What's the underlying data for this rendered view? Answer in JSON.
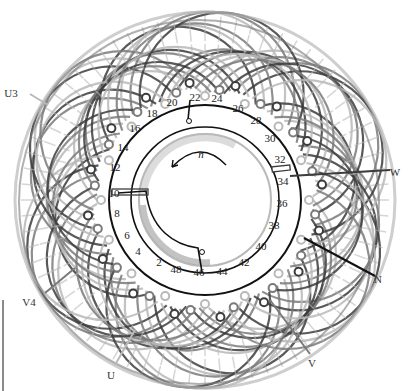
{
  "diagram": {
    "center": {
      "x": 205,
      "y": 200
    },
    "colors": {
      "phase_dark": "#3c3c3c",
      "phase_mid": "#7a7a7a",
      "phase_light": "#b9b9b9",
      "ring": "#111111",
      "background": "#ffffff"
    },
    "rotation_label": "n",
    "slot_labels": [
      {
        "text": "2",
        "x": 159,
        "y": 263
      },
      {
        "text": "4",
        "x": 138,
        "y": 252
      },
      {
        "text": "6",
        "x": 127,
        "y": 236
      },
      {
        "text": "8",
        "x": 117,
        "y": 214
      },
      {
        "text": "10",
        "x": 114,
        "y": 194
      },
      {
        "text": "12",
        "x": 115,
        "y": 168
      },
      {
        "text": "14",
        "x": 123,
        "y": 148
      },
      {
        "text": "16",
        "x": 135,
        "y": 129
      },
      {
        "text": "18",
        "x": 152,
        "y": 114
      },
      {
        "text": "20",
        "x": 172,
        "y": 103
      },
      {
        "text": "22",
        "x": 195,
        "y": 98
      },
      {
        "text": "24",
        "x": 217,
        "y": 99
      },
      {
        "text": "26",
        "x": 238,
        "y": 109
      },
      {
        "text": "28",
        "x": 256,
        "y": 121
      },
      {
        "text": "30",
        "x": 270,
        "y": 139
      },
      {
        "text": "32",
        "x": 280,
        "y": 160
      },
      {
        "text": "34",
        "x": 283,
        "y": 182
      },
      {
        "text": "36",
        "x": 282,
        "y": 204
      },
      {
        "text": "38",
        "x": 274,
        "y": 226
      },
      {
        "text": "40",
        "x": 261,
        "y": 247
      },
      {
        "text": "42",
        "x": 244,
        "y": 263
      },
      {
        "text": "44",
        "x": 222,
        "y": 272
      },
      {
        "text": "46",
        "x": 199,
        "y": 273
      },
      {
        "text": "48",
        "x": 176,
        "y": 270
      }
    ],
    "terminals": [
      {
        "text": "U3",
        "x": 11,
        "y": 94,
        "lx1": 30,
        "ly1": 94,
        "lx2": 48,
        "ly2": 105,
        "color": "#b9b9b9"
      },
      {
        "text": "W",
        "x": 395,
        "y": 173,
        "lx1": 290,
        "ly1": 176,
        "lx2": 390,
        "ly2": 170,
        "color": "#3c3c3c"
      },
      {
        "text": "N",
        "x": 378,
        "y": 280,
        "lx1": 304,
        "ly1": 238,
        "lx2": 375,
        "ly2": 276,
        "color": "#111111"
      },
      {
        "text": "V",
        "x": 312,
        "y": 364,
        "lx1": 270,
        "ly1": 300,
        "lx2": 310,
        "ly2": 354,
        "color": "#7a7a7a"
      },
      {
        "text": "U",
        "x": 111,
        "y": 376,
        "lx1": 135,
        "ly1": 330,
        "lx2": 115,
        "ly2": 365,
        "color": "#b9b9b9"
      },
      {
        "text": "V4",
        "x": 29,
        "y": 303,
        "lx1": 45,
        "ly1": 293,
        "lx2": 75,
        "ly2": 268,
        "color": "#7a7a7a"
      }
    ]
  }
}
